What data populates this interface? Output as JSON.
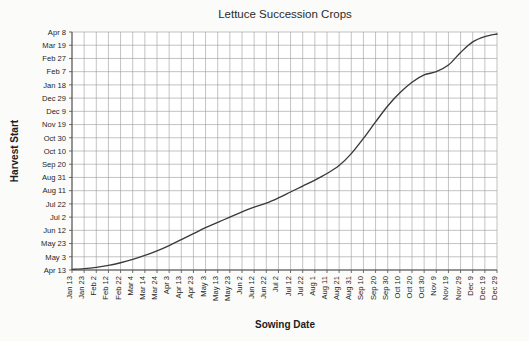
{
  "chart_data": {
    "type": "line",
    "title": "Lettuce Succession Crops",
    "xlabel": "Sowing Date",
    "ylabel": "Harvest Start",
    "grid": true,
    "legend": null,
    "xlim": [
      "Jan 13",
      "Dec 29"
    ],
    "ylim": [
      "Apr 13",
      "Apr 8"
    ],
    "x_tick_step_days": 10,
    "y_tick_step_days": 20,
    "categories": [
      "Jan 13",
      "Jan 23",
      "Feb 2",
      "Feb 12",
      "Feb 22",
      "Mar 4",
      "Mar 14",
      "Mar 24",
      "Apr 3",
      "Apr 13",
      "Apr 23",
      "May 3",
      "May 13",
      "May 23",
      "Jun 2",
      "Jun 12",
      "Jun 22",
      "Jul 2",
      "Jul 12",
      "Jul 22",
      "Aug 1",
      "Aug 11",
      "Aug 21",
      "Aug 31",
      "Sep 10",
      "Sep 20",
      "Sep 30",
      "Oct 10",
      "Oct 20",
      "Oct 30",
      "Nov 9",
      "Nov 19",
      "Nov 29",
      "Dec 9",
      "Dec 19",
      "Dec 29"
    ],
    "ytick_labels": [
      "Apr 8",
      "Mar 19",
      "Feb 27",
      "Feb 7",
      "Jan 18",
      "Dec 29",
      "Dec 9",
      "Nov 19",
      "Oct 30",
      "Oct 10",
      "Sep 20",
      "Aug 31",
      "Aug 11",
      "Jul 22",
      "Jul 2",
      "Jun 12",
      "May 23",
      "May 3",
      "Apr 13"
    ],
    "ytick_values": [
      360,
      340,
      320,
      300,
      280,
      260,
      240,
      220,
      200,
      180,
      160,
      140,
      120,
      100,
      80,
      60,
      40,
      20,
      0
    ],
    "series": [
      {
        "name": "Harvest start vs sowing date",
        "values": [
          1,
          2,
          4,
          7,
          11,
          16,
          22,
          29,
          37,
          46,
          55,
          64,
          72,
          80,
          88,
          95,
          101,
          109,
          118,
          127,
          136,
          146,
          158,
          176,
          199,
          224,
          248,
          268,
          284,
          295,
          300,
          310,
          329,
          345,
          353,
          357
        ]
      }
    ]
  }
}
